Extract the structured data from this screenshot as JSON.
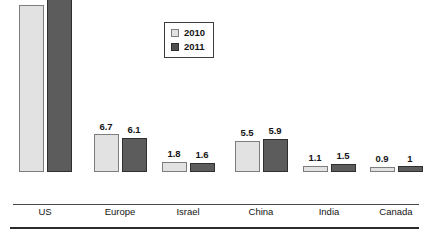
{
  "chart_data": {
    "type": "bar",
    "title": "",
    "subtitle": "",
    "xlabel": "",
    "ylabel": "",
    "ylim": [
      0,
      32.6
    ],
    "grid": false,
    "legend_position": "top-center",
    "axis": {
      "y_ticks_visible": false,
      "y_tick_labels": [],
      "x_axis_line": true,
      "value_labels_shown": true
    },
    "categories": [
      "US",
      "Europe",
      "Israel",
      "China",
      "India",
      "Canada"
    ],
    "series": [
      {
        "name": "2010",
        "color": "#e2e2e2",
        "border_color": "#7d7d7d",
        "values": [
          29.6,
          6.7,
          1.8,
          5.5,
          1.1,
          0.9
        ],
        "value_labels": [
          "29.6",
          "6.7",
          "1.8",
          "5.5",
          "1.1",
          "0.9"
        ]
      },
      {
        "name": "2011",
        "color": "#5c5c5c",
        "border_color": "#2f2f2f",
        "values": [
          32.6,
          6.1,
          1.6,
          5.9,
          1.5,
          1.0
        ],
        "value_labels": [
          "32.6",
          "6.1",
          "1.6",
          "5.9",
          "1.5",
          "1"
        ]
      }
    ]
  },
  "legend": {
    "entries": [
      {
        "label": "2010",
        "swatch": "light-gray-square"
      },
      {
        "label": "2011",
        "swatch": "dark-gray-square"
      }
    ]
  },
  "colors": {
    "series_2010": "#e2e2e2",
    "series_2010_border": "#7d7d7d",
    "series_2011": "#5c5c5c",
    "series_2011_border": "#2f2f2f",
    "axis": "#4a4a4a",
    "rule": "#2b2b2b",
    "text": "#151515",
    "background": "#ffffff"
  },
  "layout": {
    "group_centers_px": [
      45,
      120,
      188,
      261,
      329,
      396
    ],
    "group_width_px": 58,
    "baseline_y_px": 204,
    "scale_height_px": 184,
    "bottom_rule_y_px": 227
  }
}
